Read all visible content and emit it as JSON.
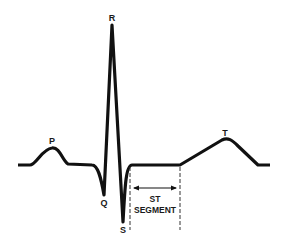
{
  "diagram": {
    "type": "ecg-waveform",
    "colors": {
      "background": "#ffffff",
      "stroke": "#111111"
    },
    "labels": {
      "p": "P",
      "q": "Q",
      "r": "R",
      "s": "S",
      "t": "T",
      "st_line1": "ST",
      "st_line2": "SEGMENT"
    }
  }
}
